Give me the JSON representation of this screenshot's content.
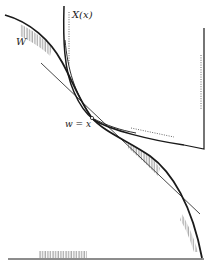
{
  "figure": {
    "labels": {
      "curve_x": "X(x)",
      "curve_w": "W",
      "tangent_point": "w = x"
    },
    "colors": {
      "ink": "#1a1a1a",
      "hatch": "#555555",
      "background": "#ffffff"
    }
  }
}
